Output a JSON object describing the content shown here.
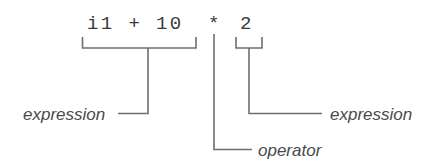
{
  "diagram": {
    "background_color": "#ffffff",
    "line_color": "#6e6e6e",
    "code_color": "#3a3a3a",
    "label_color": "#4a4a4a",
    "code": {
      "full": "i1 + 10 * 2",
      "left_operand": "i1 + 10",
      "operator": "*",
      "right_operand": "2"
    },
    "labels": {
      "left_expression": "expression",
      "operator": "operator",
      "right_expression": "expression"
    }
  }
}
